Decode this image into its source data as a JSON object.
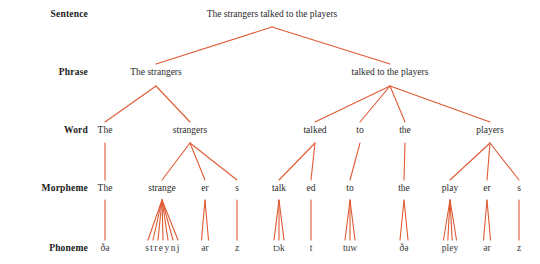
{
  "figure": {
    "line_color": "#e05a33",
    "text_color": "#2a2a2a",
    "label_color": "#1a1a1a",
    "background": "#ffffff",
    "width": 540,
    "height": 264
  },
  "row_labels": [
    {
      "name": "sentence",
      "text": "Sentence",
      "x": 88,
      "y": 14
    },
    {
      "name": "phrase",
      "text": "Phrase",
      "x": 88,
      "y": 72
    },
    {
      "name": "word",
      "text": "Word",
      "x": 88,
      "y": 130
    },
    {
      "name": "morpheme",
      "text": "Morpheme",
      "x": 88,
      "y": 188
    },
    {
      "name": "phoneme",
      "text": "Phoneme",
      "x": 88,
      "y": 248
    }
  ],
  "levels": {
    "sentence": {
      "label": "Sentence",
      "y": 14,
      "nodes": [
        {
          "id": "s0",
          "text": "The strangers talked to the players",
          "x": 272
        }
      ]
    },
    "phrase": {
      "label": "Phrase",
      "y": 72,
      "nodes": [
        {
          "id": "p0",
          "text": "The strangers",
          "x": 156
        },
        {
          "id": "p1",
          "text": "talked to the players",
          "x": 390
        }
      ]
    },
    "word": {
      "label": "Word",
      "y": 130,
      "nodes": [
        {
          "id": "w0",
          "text": "The",
          "x": 105
        },
        {
          "id": "w1",
          "text": "strangers",
          "x": 190
        },
        {
          "id": "w2",
          "text": "talked",
          "x": 315
        },
        {
          "id": "w3",
          "text": "to",
          "x": 360
        },
        {
          "id": "w4",
          "text": "the",
          "x": 405
        },
        {
          "id": "w5",
          "text": "players",
          "x": 490
        }
      ]
    },
    "morpheme": {
      "label": "Morpheme",
      "y": 188,
      "nodes": [
        {
          "id": "m0",
          "text": "The",
          "x": 105
        },
        {
          "id": "m1",
          "text": "strange",
          "x": 162
        },
        {
          "id": "m2",
          "text": "er",
          "x": 205
        },
        {
          "id": "m3",
          "text": "s",
          "x": 237
        },
        {
          "id": "m4",
          "text": "talk",
          "x": 279
        },
        {
          "id": "m5",
          "text": "ed",
          "x": 311
        },
        {
          "id": "m6",
          "text": "to",
          "x": 350
        },
        {
          "id": "m7",
          "text": "the",
          "x": 404
        },
        {
          "id": "m8",
          "text": "play",
          "x": 450
        },
        {
          "id": "m9",
          "text": "er",
          "x": 487
        },
        {
          "id": "m10",
          "text": "s",
          "x": 519
        }
      ]
    },
    "phoneme": {
      "label": "Phoneme",
      "y": 248,
      "nodes": [
        {
          "id": "f0",
          "text": "ðə",
          "x": 105,
          "spaced": false
        },
        {
          "id": "f1",
          "text": "streynj",
          "x": 163,
          "spaced": true
        },
        {
          "id": "f2",
          "text": "ər",
          "x": 205,
          "spaced": false
        },
        {
          "id": "f3",
          "text": "z",
          "x": 237,
          "spaced": false
        },
        {
          "id": "f4",
          "text": "tɔk",
          "x": 279,
          "spaced": false
        },
        {
          "id": "f5",
          "text": "t",
          "x": 311,
          "spaced": false
        },
        {
          "id": "f6",
          "text": "tuw",
          "x": 350,
          "spaced": false
        },
        {
          "id": "f7",
          "text": "ðə",
          "x": 404,
          "spaced": false
        },
        {
          "id": "f8",
          "text": "pley",
          "x": 450,
          "spaced": false
        },
        {
          "id": "f9",
          "text": "ər",
          "x": 487,
          "spaced": false
        },
        {
          "id": "f10",
          "text": "z",
          "x": 519,
          "spaced": false
        }
      ]
    }
  },
  "edges": [
    {
      "from": "s0",
      "to": "p0",
      "from_y": 27,
      "to_y": 64
    },
    {
      "from": "s0",
      "to": "p1",
      "from_y": 27,
      "to_y": 64
    },
    {
      "from": "p0",
      "to": "w0",
      "from_y": 86,
      "to_y": 122
    },
    {
      "from": "p0",
      "to": "w1",
      "from_y": 86,
      "to_y": 122
    },
    {
      "from": "p1",
      "to": "w2",
      "from_y": 86,
      "to_y": 122
    },
    {
      "from": "p1",
      "to": "w3",
      "from_y": 86,
      "to_y": 122
    },
    {
      "from": "p1",
      "to": "w4",
      "from_y": 86,
      "to_y": 122
    },
    {
      "from": "p1",
      "to": "w5",
      "from_y": 86,
      "to_y": 122
    },
    {
      "from": "w0",
      "to": "m0",
      "from_y": 143,
      "to_y": 180
    },
    {
      "from": "w1",
      "to": "m1",
      "from_y": 143,
      "to_y": 180
    },
    {
      "from": "w1",
      "to": "m2",
      "from_y": 143,
      "to_y": 180
    },
    {
      "from": "w1",
      "to": "m3",
      "from_y": 143,
      "to_y": 180
    },
    {
      "from": "w2",
      "to": "m4",
      "from_y": 143,
      "to_y": 180
    },
    {
      "from": "w2",
      "to": "m5",
      "from_y": 143,
      "to_y": 180
    },
    {
      "from": "w3",
      "to": "m6",
      "from_y": 143,
      "to_y": 180
    },
    {
      "from": "w4",
      "to": "m7",
      "from_y": 143,
      "to_y": 180
    },
    {
      "from": "w5",
      "to": "m8",
      "from_y": 143,
      "to_y": 180
    },
    {
      "from": "w5",
      "to": "m9",
      "from_y": 143,
      "to_y": 180
    },
    {
      "from": "w5",
      "to": "m10",
      "from_y": 143,
      "to_y": 180
    }
  ],
  "phoneme_fans": [
    {
      "parent": "m0",
      "child": "f0",
      "count": 1,
      "spread": 0,
      "from_y": 200,
      "to_y": 240
    },
    {
      "parent": "m1",
      "child": "f1",
      "count": 7,
      "spread": 30,
      "from_y": 200,
      "to_y": 240
    },
    {
      "parent": "m2",
      "child": "f2",
      "count": 2,
      "spread": 7,
      "from_y": 200,
      "to_y": 240
    },
    {
      "parent": "m3",
      "child": "f3",
      "count": 1,
      "spread": 0,
      "from_y": 200,
      "to_y": 240
    },
    {
      "parent": "m4",
      "child": "f4",
      "count": 3,
      "spread": 10,
      "from_y": 200,
      "to_y": 240
    },
    {
      "parent": "m5",
      "child": "f5",
      "count": 1,
      "spread": 0,
      "from_y": 200,
      "to_y": 240
    },
    {
      "parent": "m6",
      "child": "f6",
      "count": 3,
      "spread": 10,
      "from_y": 200,
      "to_y": 240
    },
    {
      "parent": "m7",
      "child": "f7",
      "count": 2,
      "spread": 8,
      "from_y": 200,
      "to_y": 240
    },
    {
      "parent": "m8",
      "child": "f8",
      "count": 4,
      "spread": 13,
      "from_y": 200,
      "to_y": 240
    },
    {
      "parent": "m9",
      "child": "f9",
      "count": 2,
      "spread": 7,
      "from_y": 200,
      "to_y": 240
    },
    {
      "parent": "m10",
      "child": "f10",
      "count": 1,
      "spread": 0,
      "from_y": 200,
      "to_y": 240
    }
  ]
}
